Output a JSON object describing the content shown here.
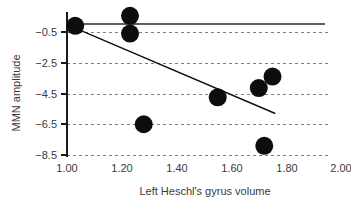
{
  "chart_data": {
    "type": "scatter",
    "title": "",
    "xlabel": "Left Heschl's gyrus volume",
    "ylabel": "MMN amplitude",
    "xlim": [
      1.0,
      2.0
    ],
    "ylim": [
      -9.5,
      1.5
    ],
    "xticks": [
      "1.00",
      "1.20",
      "1.40",
      "1.60",
      "1.80",
      "2.00"
    ],
    "xtick_values": [
      1.0,
      1.2,
      1.4,
      1.6,
      1.8,
      2.0
    ],
    "yticks": [
      "−0.5",
      "−2.5",
      "−4.5",
      "−6.5",
      "−8.5"
    ],
    "ytick_values": [
      -0.5,
      -2.5,
      -4.5,
      -6.5,
      -8.5
    ],
    "grid": "horizontal-dashed",
    "legend": "none",
    "points": [
      {
        "x": 1.03,
        "y": -0.1
      },
      {
        "x": 1.23,
        "y": 0.55
      },
      {
        "x": 1.23,
        "y": -0.6
      },
      {
        "x": 1.28,
        "y": -6.5
      },
      {
        "x": 1.55,
        "y": -4.75
      },
      {
        "x": 1.7,
        "y": -4.15
      },
      {
        "x": 1.75,
        "y": -3.4
      },
      {
        "x": 1.72,
        "y": -7.9
      }
    ],
    "point_radius_px": 9,
    "point_color": "#0d0d0d",
    "reference_line": {
      "y": 0.0,
      "x_start": 1.0,
      "x_end": 1.94,
      "style": "solid"
    },
    "fit_line": {
      "x_start": 1.03,
      "y_start": -0.25,
      "x_end": 1.76,
      "y_end": -5.8,
      "style": "solid"
    }
  }
}
